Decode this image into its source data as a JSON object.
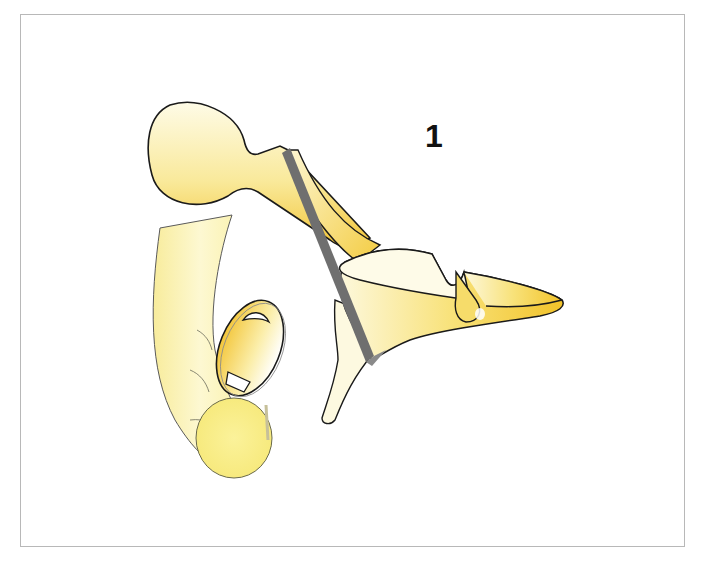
{
  "figure": {
    "label": "1",
    "parts": [
      {
        "name": "malleus",
        "shape": "head with long curved manubrium"
      },
      {
        "name": "incus",
        "shape": "body with long and short process"
      },
      {
        "name": "stapes",
        "shape": "head, crura and footplate"
      },
      {
        "name": "section-line",
        "shape": "gray diagonal bar"
      },
      {
        "name": "lenticular-process",
        "shape": "oval disc"
      }
    ],
    "colors": {
      "frame_border": "#b8b8b8",
      "outline": "#1a1a1a",
      "fill_light": "#fdf9d8",
      "fill_mid": "#f8e58a",
      "fill_deep": "#f2c530",
      "cut_line": "#6f6f6f"
    }
  }
}
